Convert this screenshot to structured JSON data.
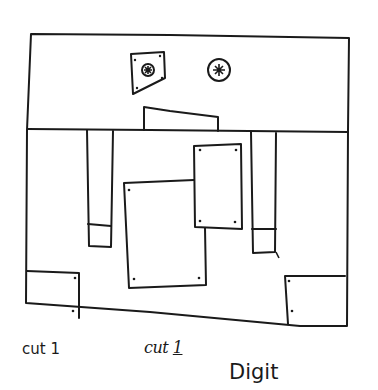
{
  "diagram": {
    "stroke_color": "#1a1a1a",
    "background": "#ffffff",
    "shapes": {
      "outer_frame": "rectangle",
      "divider": "horizontal line",
      "left_eye": "quadrilateral with circle and star pupil",
      "right_eye": "circle with star pupil",
      "nose": "trapezoid",
      "left_pillar": "tall narrow rectangle with bottom segment",
      "right_pillar": "tall narrow rectangle with bottom segment",
      "center_front_panel": "rectangle with 4 corner dots",
      "center_back_panel": "rectangle partially behind front panel",
      "bottom_left_block": "square with 2 dots",
      "bottom_right_block": "square with 2 dots"
    }
  },
  "labels": {
    "typed_label": "cut 1",
    "handwritten_label_prefix": "cut ",
    "handwritten_label_number": "1",
    "digit_label": "Digit"
  }
}
